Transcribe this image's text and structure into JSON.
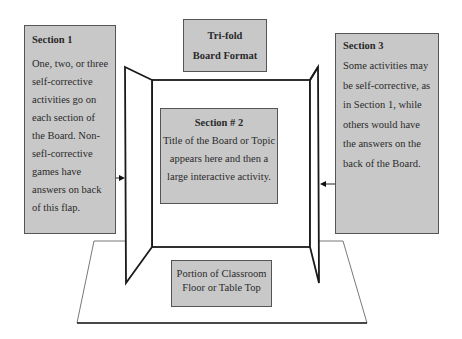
{
  "title_box": {
    "line1": "Tri-fold",
    "line2": "Board Format"
  },
  "section1": {
    "heading": "Section 1",
    "body": "One, two, or three self-corrective activities go on each section of the Board. Non-sefl-corrective games have answers on back of this flap."
  },
  "section2": {
    "heading": "Section # 2",
    "body": "Title of the Board or Topic appears here and then a large interactive activity."
  },
  "section3": {
    "heading": "Section 3",
    "body": "Some activities may be self-corrective, as in Section 1, while others would have the answers on the back of the Board."
  },
  "floor": {
    "label_line1": "Portion of Classroom",
    "label_line2": "Floor or Table Top"
  },
  "colors": {
    "box_fill": "#c8c8c8",
    "box_border": "#555555",
    "board_line": "#1a1a1a",
    "floor_line": "#444444"
  }
}
